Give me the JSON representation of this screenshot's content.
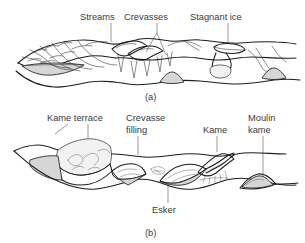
{
  "figure": {
    "title_hidden": "Formation of kames, eskers and kame terraces by stagnant ice",
    "background_color": "#ffffff",
    "ink_color": "#1d1d1d",
    "fill_color": "#d6d6d6",
    "label_color": "#3a3a3a"
  },
  "panel_a": {
    "caption": "(a)",
    "labels": [
      {
        "text": "Streams",
        "name": "label-streams"
      },
      {
        "text": "Crevasses",
        "name": "label-crevasses"
      },
      {
        "text": "Stagnant ice",
        "name": "label-stagnant-ice"
      }
    ]
  },
  "panel_b": {
    "caption": "(b)",
    "labels": [
      {
        "text": "Kame terrace",
        "name": "label-kame-terrace"
      },
      {
        "text": "Crevasse",
        "name": "label-crevasse-filling-line1"
      },
      {
        "text": "filling",
        "name": "label-crevasse-filling-line2"
      },
      {
        "text": "Kame",
        "name": "label-kame"
      },
      {
        "text": "Moulin",
        "name": "label-moulin-kame-line1"
      },
      {
        "text": "kame",
        "name": "label-moulin-kame-line2"
      },
      {
        "text": "Esker",
        "name": "label-esker"
      }
    ]
  }
}
